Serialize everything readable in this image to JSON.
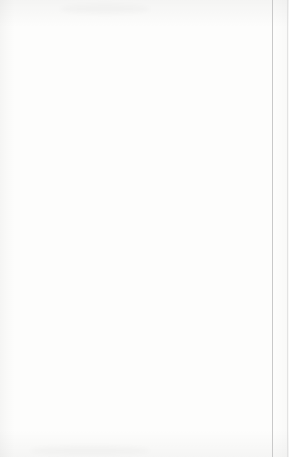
{
  "document": {
    "kind": "scanned-worksheet-graph",
    "page_border_color": "#c9c9c9"
  },
  "chart_data": {
    "type": "line",
    "title": "",
    "xlabel": "x",
    "ylabel": "y",
    "xlim": [
      -5,
      5
    ],
    "ylim": [
      -10,
      6
    ],
    "grid": true,
    "grid_step": 1,
    "legend": "none",
    "axis_color": "#8a8a8a",
    "grid_color": "#b9b9b9",
    "line_color": "#555555",
    "point_color": "#3a3a3a",
    "xticks": [
      -5,
      -4,
      -3,
      -2,
      -1,
      0,
      1,
      2,
      3,
      4,
      5
    ],
    "xtick_labels": [
      "-5",
      "-4",
      "-3",
      "-2",
      "-1",
      "0",
      "1",
      "2",
      "3",
      "4",
      "5"
    ],
    "yticks": [
      6,
      5,
      4,
      3,
      2,
      1,
      0,
      -1,
      -2,
      -3,
      -4,
      -5,
      -6,
      -7,
      -8,
      -9,
      -10
    ],
    "ytick_labels": [
      "6",
      "5",
      "4",
      "3",
      "2",
      "1",
      "0",
      "-1",
      "-2",
      "-3",
      "-4",
      "-5",
      "-6",
      "-7",
      "-8",
      "-9",
      "-10"
    ],
    "series": [
      {
        "name": "line",
        "slope": 10,
        "intercept": -4,
        "x": [
          -1.05,
          1.1
        ],
        "y": [
          -14.5,
          7.0
        ]
      }
    ],
    "points": [
      {
        "x": 1,
        "y": 6,
        "label": ""
      },
      {
        "x": 0,
        "y": -4,
        "label": ""
      },
      {
        "x": -1,
        "y": -9,
        "label": ""
      }
    ]
  },
  "axes": {
    "x_axis_label": "x",
    "y_axis_label": "y"
  }
}
